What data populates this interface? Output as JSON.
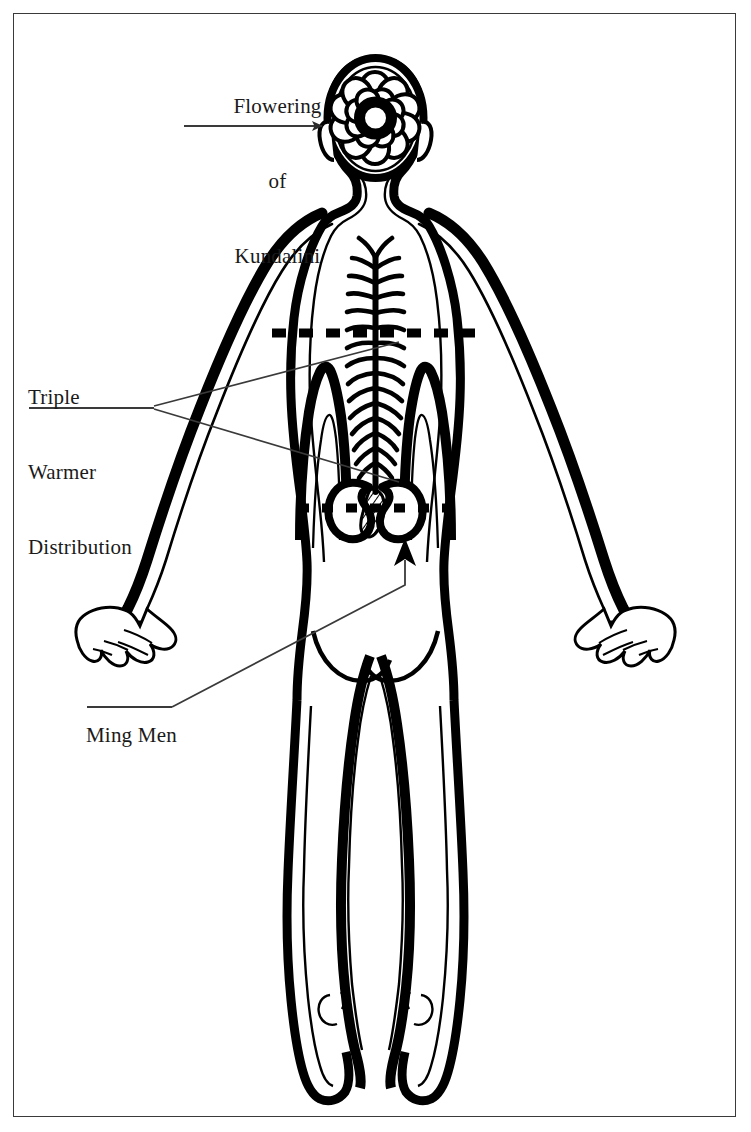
{
  "figure": {
    "view": "posterior (back) view of human body",
    "border_color": "#3a3a3a",
    "ink_color": "#000000",
    "background_color": "#ffffff"
  },
  "labels": {
    "kundalini": {
      "line1": "Flowering",
      "line2": "of",
      "line3": "Kundalini",
      "underline_word": "Kundalini",
      "pointer": "arrow pointing right to the crown lotus in the head"
    },
    "triple_warmer": {
      "line1": "Triple",
      "line2": "Warmer",
      "line3": "Distribution",
      "underline_word": "Distribution",
      "pointer": "two leader lines fanning right to the upper and middle burner zones"
    },
    "ming_men": {
      "line1": "Ming Men",
      "underline_word": "Ming Men",
      "pointer": "leader line rising to an up arrow beneath the kidneys"
    }
  },
  "anatomy": {
    "crown_lotus": {
      "name": "flowering lotus of kundalini",
      "center": "thick black ring",
      "petal_rings": 3,
      "outer_petals": 12,
      "inner_petals": 8
    },
    "spine": {
      "name": "spinal column",
      "style": "feathered vertebral branches",
      "segments": 16
    },
    "kidneys": {
      "name": "kidneys",
      "count": 2,
      "gate": "hatched Ming Men gate between the kidneys"
    },
    "divider_lines": [
      {
        "name": "upper-burner-divider",
        "y": 333,
        "style": "dashed"
      },
      {
        "name": "lower-burner-divider",
        "y": 508,
        "style": "dashed"
      }
    ],
    "burners": [
      "Upper Warmer",
      "Middle Warmer",
      "Lower Warmer"
    ]
  }
}
